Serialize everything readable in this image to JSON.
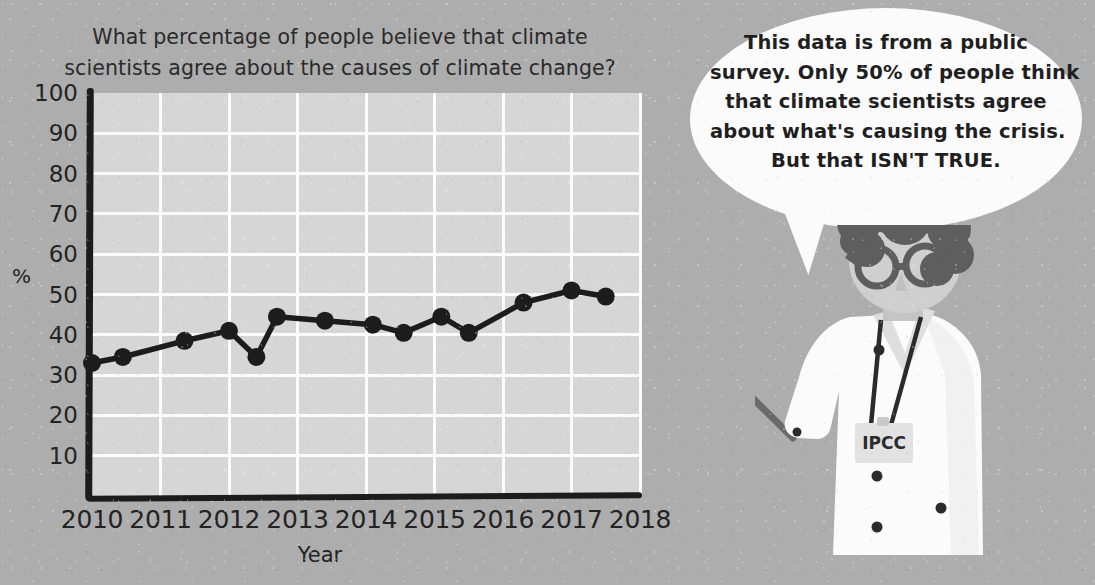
{
  "chart_data": {
    "type": "line",
    "title": "What percentage of people believe that climate scientists agree about the causes of climate change?",
    "title_lines": [
      "What percentage of people believe that climate",
      "scientists agree about the causes of climate change?"
    ],
    "xlabel": "Year",
    "ylabel": "%",
    "xlim": [
      2010,
      2018
    ],
    "ylim": [
      0,
      100
    ],
    "ytick_labels": [
      "100",
      "90",
      "80",
      "70",
      "60",
      "50",
      "40",
      "30",
      "20",
      "10"
    ],
    "ytick_values": [
      100,
      90,
      80,
      70,
      60,
      50,
      40,
      30,
      20,
      10
    ],
    "xtick_labels": [
      "2010",
      "2011",
      "2012",
      "2013",
      "2014",
      "2015",
      "2016",
      "2017",
      "2018"
    ],
    "xtick_values": [
      2010,
      2011,
      2012,
      2013,
      2014,
      2015,
      2016,
      2017,
      2018
    ],
    "grid": true,
    "legend": "none",
    "marker": "circle",
    "line_color": "#1c1c1c",
    "plot_bg": "#d6d6d6",
    "grid_color": "#fbfbfb",
    "series": [
      {
        "name": "Percent who think climate scientists agree",
        "x": [
          2010.0,
          2010.45,
          2011.35,
          2012.0,
          2012.4,
          2012.7,
          2013.4,
          2014.1,
          2014.55,
          2015.1,
          2015.5,
          2016.3,
          2017.0,
          2017.5
        ],
        "values": [
          33.0,
          34.5,
          38.5,
          41.0,
          34.5,
          44.5,
          43.5,
          42.5,
          40.5,
          44.5,
          40.5,
          48.0,
          51.0,
          49.5
        ]
      }
    ]
  },
  "bubble": {
    "lines": [
      "This data is from a public",
      "survey. Only 50% of people think",
      "that climate scientists agree",
      "about what's causing the crisis.",
      "But that ISN'T TRUE."
    ],
    "text": "This data is from a public survey. Only 50% of people think that climate scientists agree about what's causing the crisis. But that ISN'T TRUE."
  },
  "scientist": {
    "badge_label": "IPCC",
    "coat_color": "#fbfbfb",
    "hair_color": "#5e5e5e",
    "skin_color": "#cfcfcf",
    "pointer_color": "#6a6a6a"
  },
  "colors": {
    "background": "#adadad",
    "ink": "#1c1c1c",
    "plot_background": "#d6d6d6",
    "gridline": "#fbfbfb",
    "bubble": "#fbfbfb"
  }
}
